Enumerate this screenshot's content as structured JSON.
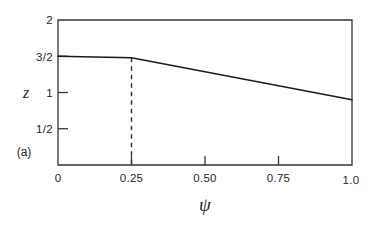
{
  "figure": {
    "panel_label": "(a)",
    "background_color": "#ffffff",
    "frame_color": "#333333",
    "curve_color": "#1a1a1a",
    "dashed_color": "#2b2b2b"
  },
  "chart_data": {
    "type": "line",
    "title": "",
    "subtitle": "",
    "xlabel": "ψ",
    "ylabel": "z",
    "xlim": [
      0,
      1.0
    ],
    "ylim": [
      0,
      2
    ],
    "grid": false,
    "legend": "none",
    "panel_label": "(a)",
    "xticks": [
      0,
      0.25,
      0.5,
      0.75,
      1.0
    ],
    "xtick_labels": [
      "0",
      "0.25",
      "0.50",
      "0.75",
      "1.0"
    ],
    "yticks": [
      0.5,
      1,
      1.5,
      2
    ],
    "ytick_labels": [
      "1/2",
      "1",
      "3/2",
      "2"
    ],
    "ytick_inside": [
      0.5,
      1,
      1.5
    ],
    "series": [
      {
        "name": "z(ψ)",
        "style": "solid",
        "x": [
          0.0,
          0.25,
          1.0
        ],
        "values": [
          1.5,
          1.48,
          0.9
        ]
      }
    ],
    "annotations": [
      {
        "name": "kink-guide",
        "type": "vertical-dashed-line",
        "x": 0.25,
        "y_from": 0.0,
        "y_to": 1.48,
        "label": ""
      }
    ]
  }
}
